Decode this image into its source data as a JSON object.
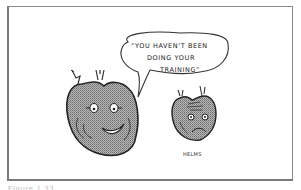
{
  "cartoon": {
    "speech_bubble": {
      "lines": [
        "“YOU HAVEN'T BEEN",
        "DOING YOUR",
        "TRAINING”"
      ]
    },
    "characters": [
      {
        "name": "smiling-heart",
        "expression": "happy"
      },
      {
        "name": "worried-heart",
        "expression": "sad"
      }
    ],
    "signature": "HELMS"
  },
  "caption": "Figure 1.33",
  "colors": {
    "frame": "#8a8a8a",
    "ink": "#222222",
    "heart_fill": "#9a9a9a"
  }
}
